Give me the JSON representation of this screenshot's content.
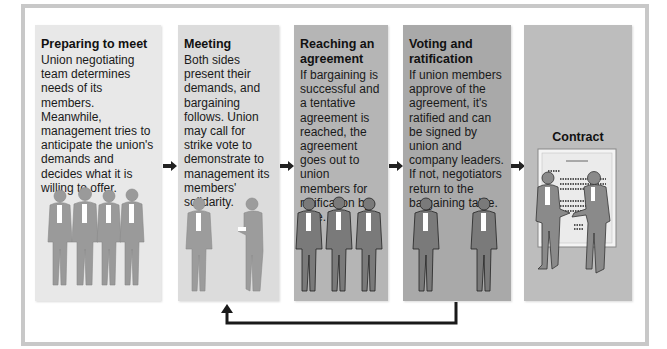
{
  "colors": {
    "frame": "#c8c8c8",
    "panel1": "#e8e8e8",
    "panel2": "#dcdcdc",
    "panel3": "#b5b5b5",
    "panel4": "#a9a9a9",
    "panel5": "#bdbdbd",
    "figure_light": "#9a9a9a",
    "figure_dark": "#7a7a7a",
    "arrow": "#222222"
  },
  "steps": [
    {
      "title": "Preparing to meet",
      "body": "Union negotiating team determines needs of its members. Meanwhile, management tries to anticipate the union's demands and decides what it is willing to offer.",
      "figures": "four-union-members"
    },
    {
      "title": "Meeting",
      "body": "Both sides present their demands, and bargaining follows. Union may call for strike vote to demonstrate to management its members' solidarity.",
      "figures": "two-negotiators"
    },
    {
      "title": "Reaching an agreement",
      "body": "If bargaining is successful and a tentative agreement is reached, the agreement goes out to union members for ratification by vote.",
      "figures": "three-union-members"
    },
    {
      "title": "Voting and ratification",
      "body": "If union members approve of the agreement, it's ratified and can be signed by union and company leaders. If not, negotiators return to the bargaining table.",
      "figures": "two-negotiators"
    },
    {
      "title": "Contract",
      "body": "",
      "figures": "handshake-in-front-of-contract"
    }
  ],
  "feedback_loop": {
    "from": "Voting and ratification",
    "to": "Meeting"
  }
}
